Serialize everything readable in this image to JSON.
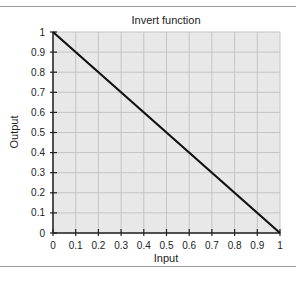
{
  "chart_data": {
    "type": "line",
    "title": "Invert function",
    "xlabel": "Input",
    "ylabel": "Output",
    "xlim": [
      0,
      1
    ],
    "ylim": [
      0,
      1
    ],
    "grid": true,
    "legend": null,
    "x_ticks": [
      "0",
      "0.1",
      "0.2",
      "0.3",
      "0.4",
      "0.5",
      "0.6",
      "0.7",
      "0.8",
      "0.9",
      "1"
    ],
    "y_ticks": [
      "0",
      "0.1",
      "0.2",
      "0.3",
      "0.4",
      "0.5",
      "0.6",
      "0.7",
      "0.8",
      "0.9",
      "1"
    ],
    "series": [
      {
        "name": "Output = 1 - Input",
        "x": [
          0,
          1
        ],
        "y": [
          1,
          0
        ],
        "color": "#111111"
      }
    ]
  },
  "colors": {
    "plot_bg": "#e8e8e8",
    "grid": "#c4c4c4",
    "axis": "#222222"
  }
}
